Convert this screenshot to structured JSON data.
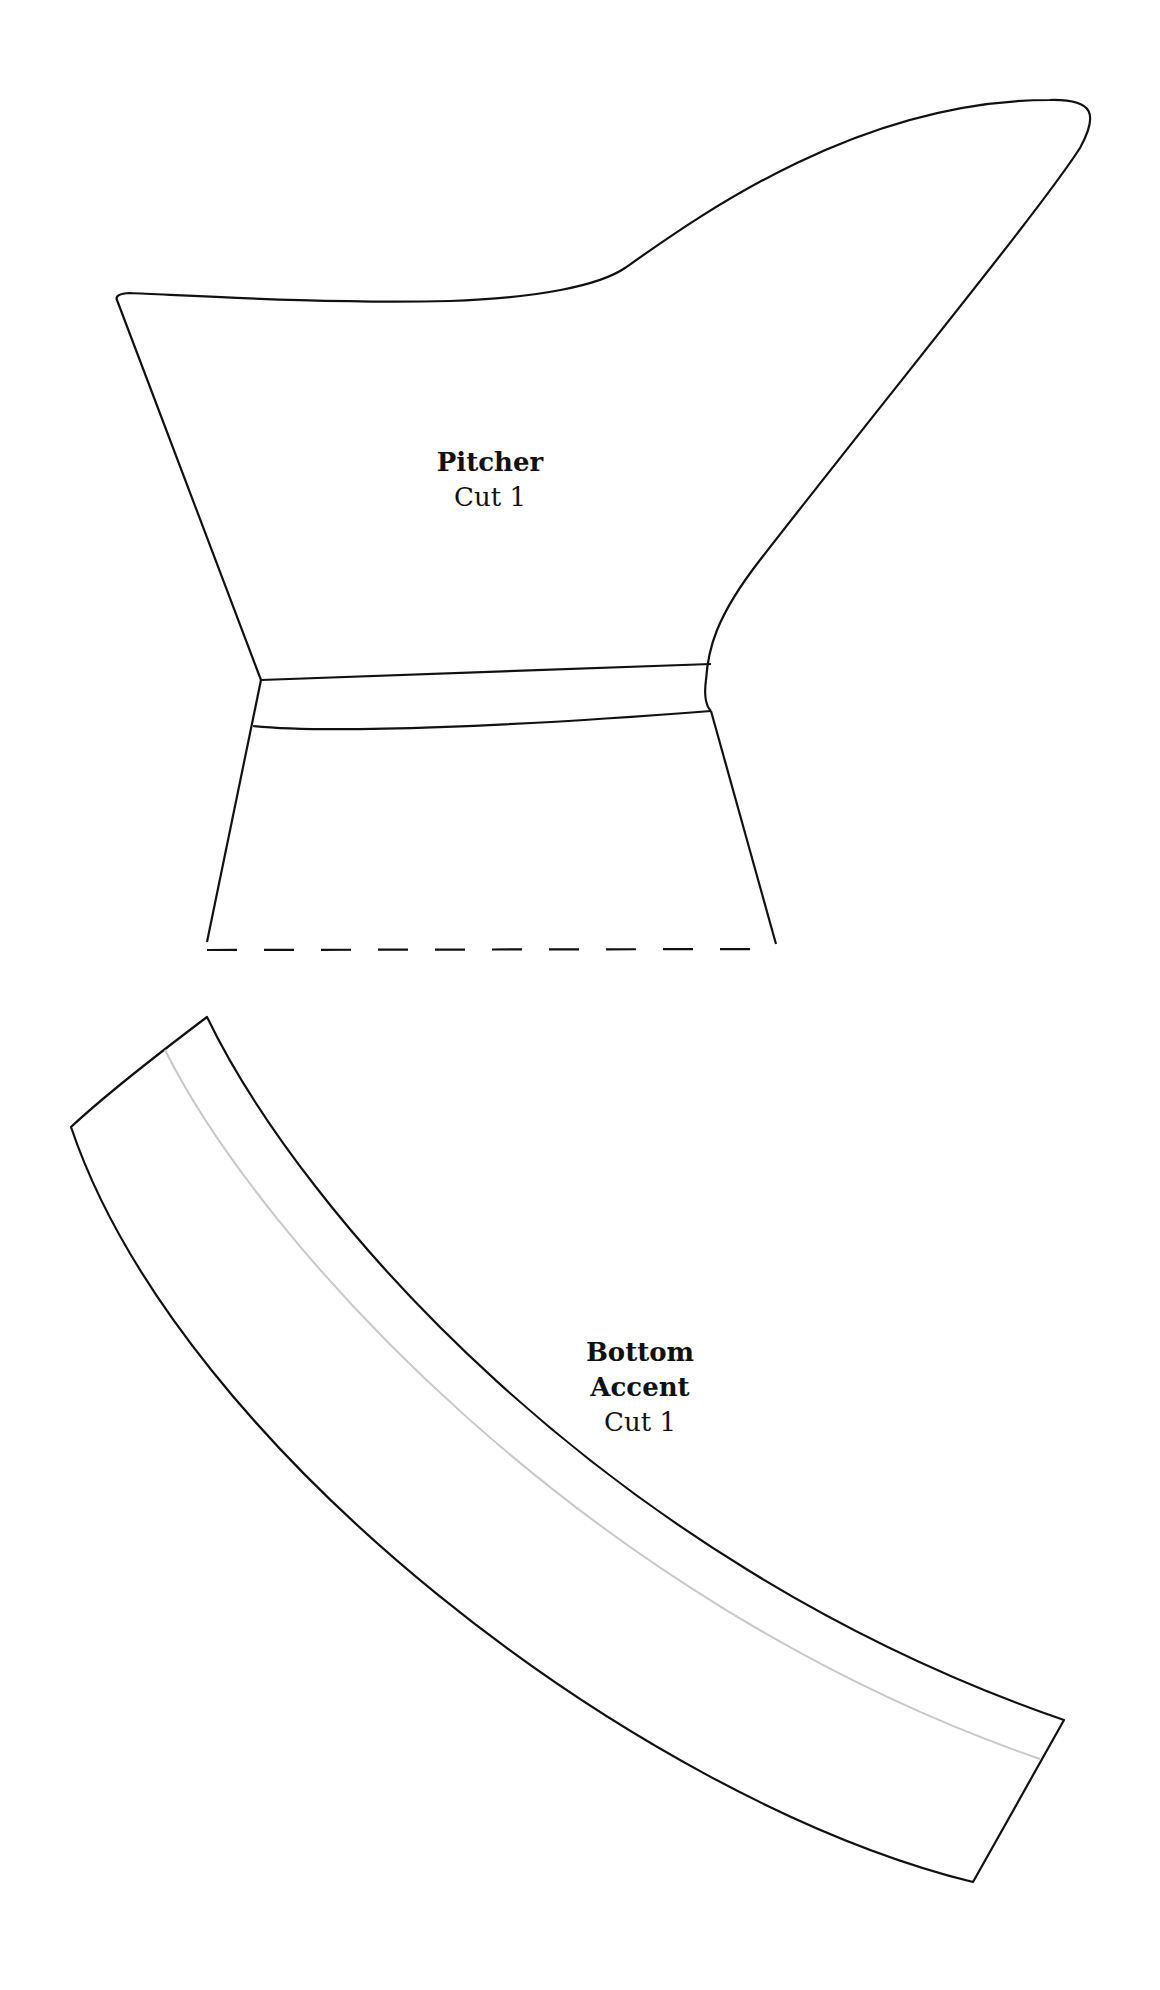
{
  "pieces": [
    {
      "id": "pitcher",
      "name": "Pitcher",
      "cut": "Cut 1"
    },
    {
      "id": "bottom-accent",
      "name_lines": [
        "Bottom",
        "Accent"
      ],
      "cut": "Cut 1"
    }
  ],
  "colors": {
    "outline": "#111111",
    "inner_guide": "#c8c8c8",
    "background": "#ffffff"
  }
}
